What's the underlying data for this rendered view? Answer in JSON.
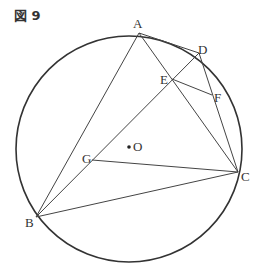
{
  "figure": {
    "label": "図 9"
  },
  "diagram": {
    "circle": {
      "cx": 129,
      "cy": 149,
      "r": 113,
      "stroke": "#333333"
    },
    "center": {
      "name": "O",
      "x": 129,
      "y": 147
    },
    "points": {
      "A": {
        "label": "A",
        "x": 139,
        "y": 33
      },
      "B": {
        "label": "B",
        "x": 36,
        "y": 217
      },
      "C": {
        "label": "C",
        "x": 238,
        "y": 172
      },
      "D": {
        "label": "D",
        "x": 199,
        "y": 53
      },
      "E": {
        "label": "E",
        "x": 172,
        "y": 79
      },
      "F": {
        "label": "F",
        "x": 212,
        "y": 95
      },
      "G": {
        "label": "G",
        "x": 92,
        "y": 160
      }
    },
    "segments": [
      [
        "A",
        "B"
      ],
      [
        "A",
        "C"
      ],
      [
        "A",
        "D"
      ],
      [
        "D",
        "B"
      ],
      [
        "D",
        "C"
      ],
      [
        "E",
        "F"
      ],
      [
        "G",
        "C"
      ],
      [
        "B",
        "C"
      ],
      [
        "B",
        "G"
      ]
    ]
  }
}
